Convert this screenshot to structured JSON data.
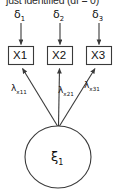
{
  "figure": {
    "type": "sem-path-diagram",
    "title_partial": "just identified (df = 0)",
    "caption_note": "top line is cropped at image edge"
  },
  "errors": [
    {
      "name": "delta-1",
      "symbol": "δ",
      "subscript": "1"
    },
    {
      "name": "delta-2",
      "symbol": "δ",
      "subscript": "2"
    },
    {
      "name": "delta-3",
      "symbol": "δ",
      "subscript": "3"
    }
  ],
  "indicators": [
    {
      "name": "x1-box",
      "label": "X1"
    },
    {
      "name": "x2-box",
      "label": "X2"
    },
    {
      "name": "x3-box",
      "label": "X3"
    }
  ],
  "loadings": [
    {
      "name": "lambda-x11",
      "symbol": "λ",
      "subscript": "x11"
    },
    {
      "name": "lambda-x21",
      "symbol": "λ",
      "subscript": "x21"
    },
    {
      "name": "lambda-x31",
      "symbol": "λ",
      "subscript": "x31"
    }
  ],
  "latent": {
    "name": "xi-1",
    "symbol": "ξ",
    "subscript": "1"
  },
  "colors": {
    "stroke": "#3a3a3a",
    "text": "#111111",
    "background": "#ffffff"
  }
}
